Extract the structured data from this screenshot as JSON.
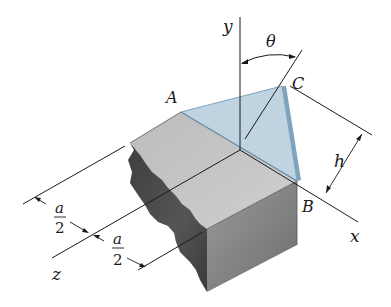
{
  "figure": {
    "axes": {
      "x": "x",
      "y": "y",
      "z": "z"
    },
    "points": {
      "A": "A",
      "B": "B",
      "C": "C"
    },
    "angle_label": "θ",
    "dimensions": {
      "h": "h",
      "a_half_1": {
        "num": "a",
        "den": "2"
      },
      "a_half_2": {
        "num": "a",
        "den": "2"
      }
    },
    "colors": {
      "plane_fill": "#a9c4d6",
      "plane_edge": "#7fa3bd",
      "block_top": "#c4c4c4",
      "block_front": "#8a8a8a",
      "block_broken_face": "#4a4a4a",
      "line": "#1a1a1a"
    }
  }
}
